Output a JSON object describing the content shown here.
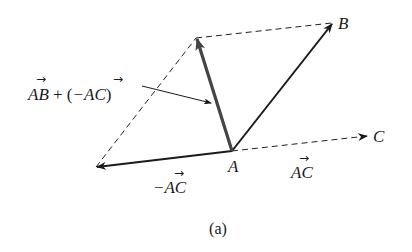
{
  "diagram": {
    "type": "vector-parallelogram",
    "caption": "(a)",
    "points": {
      "A": {
        "label": "A",
        "x": 232,
        "y": 151
      },
      "B": {
        "label": "B",
        "x": 332,
        "y": 23
      },
      "C": {
        "label": "C",
        "x": 367,
        "y": 136
      },
      "negC": {
        "x": 96,
        "y": 167
      },
      "sum": {
        "x": 195,
        "y": 38
      }
    },
    "vectors": [
      {
        "name": "AB",
        "from": "A",
        "to": "B",
        "style": "solid"
      },
      {
        "name": "AC",
        "from": "A",
        "to": "C",
        "style": "dashed"
      },
      {
        "name": "-AC",
        "from": "A",
        "to": "negC",
        "style": "solid"
      },
      {
        "name": "AB + (-AC)",
        "from": "A",
        "to": "sum",
        "style": "solid-thick-gray"
      }
    ],
    "labels": {
      "point_A": "A",
      "point_B": "B",
      "point_C": "C",
      "vec_AC": "AC",
      "vec_negAC": "−AC",
      "sum_part1": "AB",
      "sum_plus": " + (",
      "sum_part2": "−AC",
      "sum_close": ")",
      "vec_arrow_glyph": "→"
    },
    "colors": {
      "line": "#1a1a1a",
      "sum_vector": "#444444",
      "dashed": "#222222"
    }
  }
}
